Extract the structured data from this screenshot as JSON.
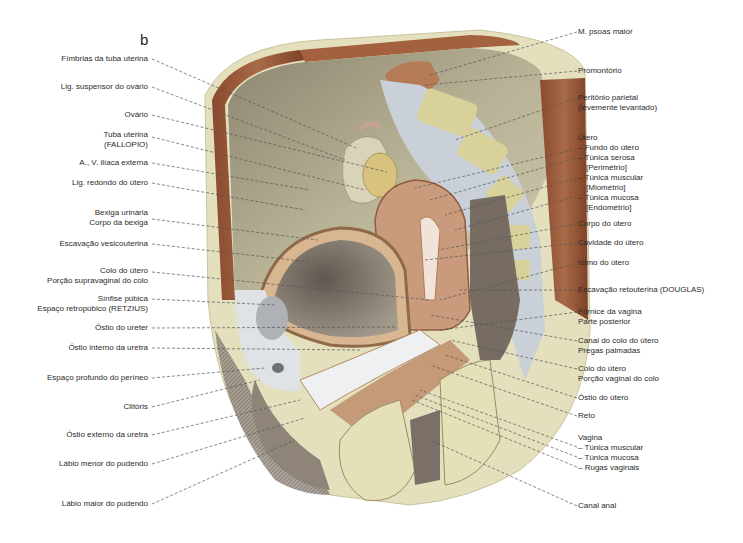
{
  "figure": {
    "panel_letter": "b",
    "colors": {
      "background": "#ffffff",
      "bone_cream": "#e6e2c0",
      "muscle_brown": "#9b5a3a",
      "peritoneum_olive": "#a9a386",
      "bladder_gray": "#8a8276",
      "uterus_pink": "#c99a7c",
      "fat_white": "#dfe3e6",
      "leader_line": "#555555"
    }
  },
  "left_labels": [
    {
      "lines": [
        "Fímbrias da tuba uterina"
      ]
    },
    {
      "lines": [
        "Lig. suspensor do ovário"
      ]
    },
    {
      "lines": [
        "Ovário"
      ]
    },
    {
      "lines": [
        "Tuba uterina",
        "(FALLOPIO)"
      ]
    },
    {
      "lines": [
        "A., V. ilíaca externa"
      ]
    },
    {
      "lines": [
        "Lig. redondo do útero"
      ]
    },
    {
      "lines": [
        "Bexiga urinária",
        "Corpo da bexiga"
      ]
    },
    {
      "lines": [
        "Escavação vesicouterina"
      ]
    },
    {
      "lines": [
        "Colo do útero",
        "Porção supravaginal do colo"
      ]
    },
    {
      "lines": [
        "Sínfise púbica",
        "Espaço retropúbico (RETZIUS)"
      ]
    },
    {
      "lines": [
        "Óstio do ureter"
      ]
    },
    {
      "lines": [
        "Óstio interno da uretra"
      ]
    },
    {
      "lines": [
        "Espaço profundo do períneo"
      ]
    },
    {
      "lines": [
        "Clitóris"
      ]
    },
    {
      "lines": [
        "Óstio externo da uretra"
      ]
    },
    {
      "lines": [
        "Lábio menor do pudendo"
      ]
    },
    {
      "lines": [
        "Lábio maior do pudendo"
      ]
    }
  ],
  "right_labels": [
    {
      "lines": [
        "M. psoas maior"
      ]
    },
    {
      "lines": [
        "Promontório"
      ]
    },
    {
      "lines": [
        "Peritônio parietal",
        "(levemente levantado)"
      ]
    },
    {
      "lines": [
        "Útero",
        "– Fundo do útero",
        "– Túnica serosa",
        "  [Perimétrio]",
        "– Túnica muscular",
        "  [Miométrio]",
        "– Túnica mucosa",
        "  [Endométrio]"
      ]
    },
    {
      "lines": [
        "Corpo do útero"
      ]
    },
    {
      "lines": [
        "Cavidade do útero"
      ]
    },
    {
      "lines": [
        "Istmo do útero"
      ]
    },
    {
      "lines": [
        "Escavação retouterina (DOUGLAS)"
      ]
    },
    {
      "lines": [
        "Fórnice da vagina",
        "Parte posterior"
      ]
    },
    {
      "lines": [
        "Canal do colo do útero",
        "Pregas palmadas"
      ]
    },
    {
      "lines": [
        "Colo do útero",
        "Porção vaginal do colo"
      ]
    },
    {
      "lines": [
        "Óstio do útero"
      ]
    },
    {
      "lines": [
        "Reto"
      ]
    },
    {
      "lines": [
        "Vagina",
        "– Túnica muscular",
        "– Túnica mucosa",
        "– Rugas vaginais"
      ]
    },
    {
      "lines": [
        "Canal anal"
      ]
    }
  ]
}
